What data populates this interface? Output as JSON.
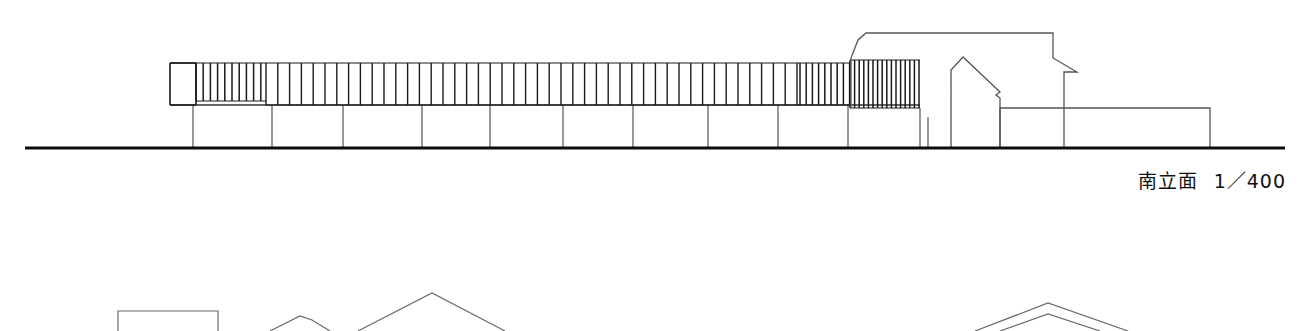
{
  "sheet": {
    "title": "南立面",
    "scale": "1/400",
    "background_color": "#ffffff",
    "ink_color": "#1a1a1a",
    "light_ink_color": "#555555"
  },
  "caption": {
    "label": "南立面",
    "scale_text": "1／400"
  },
  "elevation": {
    "name": "south-elevation",
    "ground_line": {
      "x1": 25,
      "x2": 1285,
      "y": 148,
      "thickness": 3.2
    },
    "louver_band": {
      "top": 63,
      "bottom": 105,
      "left": 170,
      "right": 920,
      "segments": [
        {
          "name": "end-bay-box",
          "x1": 170,
          "x2": 196,
          "pitch": 26,
          "stroke": 1.6,
          "top": 63,
          "bottom": 105
        },
        {
          "name": "dense-cluster-left",
          "x1": 196,
          "x2": 266,
          "pitch": 7.2,
          "stroke": 1.5,
          "top": 63,
          "bottom": 101
        },
        {
          "name": "regular-fins",
          "x1": 266,
          "x2": 800,
          "pitch": 11.8,
          "stroke": 1.4,
          "top": 63,
          "bottom": 105
        },
        {
          "name": "dense-cluster-right",
          "x1": 800,
          "x2": 850,
          "pitch": 6.2,
          "stroke": 1.5,
          "top": 63,
          "bottom": 105
        },
        {
          "name": "dense-cluster-far-right",
          "x1": 850,
          "x2": 920,
          "pitch": 4.6,
          "stroke": 1.5,
          "top": 60,
          "bottom": 108
        }
      ]
    },
    "columns": [
      {
        "x": 193,
        "y_top": 105,
        "y_bottom": 148
      },
      {
        "x": 272,
        "y_top": 105,
        "y_bottom": 148
      },
      {
        "x": 343,
        "y_top": 105,
        "y_bottom": 148
      },
      {
        "x": 422,
        "y_top": 105,
        "y_bottom": 148
      },
      {
        "x": 490,
        "y_top": 105,
        "y_bottom": 148
      },
      {
        "x": 563,
        "y_top": 105,
        "y_bottom": 148
      },
      {
        "x": 633,
        "y_top": 105,
        "y_bottom": 148
      },
      {
        "x": 708,
        "y_top": 105,
        "y_bottom": 148
      },
      {
        "x": 778,
        "y_top": 105,
        "y_bottom": 148
      },
      {
        "x": 848,
        "y_top": 105,
        "y_bottom": 148
      },
      {
        "x": 920,
        "y_top": 108,
        "y_bottom": 148
      },
      {
        "x": 928,
        "y_top": 117,
        "y_bottom": 148
      }
    ],
    "band_base_line": {
      "x1": 196,
      "x2": 920,
      "y": 105
    },
    "tall_block": {
      "name": "tall-outline-volume",
      "points": "851,108 851,58 858,40 866,33 1053,33 1053,58 1077,72 1064,72 1064,148"
    },
    "gable_house": {
      "name": "gable-house-profile",
      "points": "951,148 951,70 963,57 1000,92 996,95 1000,98 1000,148"
    },
    "low_block": {
      "name": "low-right-volume",
      "x1": 1000,
      "y1": 108,
      "x2": 1210,
      "y2": 148
    }
  },
  "lower_fragment": {
    "name": "partial-elevation-below",
    "flat_box": {
      "x1": 118,
      "y1": 311,
      "x2": 218,
      "y2": 331
    },
    "small_peak": {
      "points": "270,331 300,316 312,320 330,331"
    },
    "large_gable": {
      "points": "358,331 432,293 505,331"
    },
    "right_gable_outer": {
      "points": "975,331 1048,303 1128,331"
    },
    "right_gable_inner": {
      "points": "1000,331 1048,314 1100,331"
    }
  }
}
